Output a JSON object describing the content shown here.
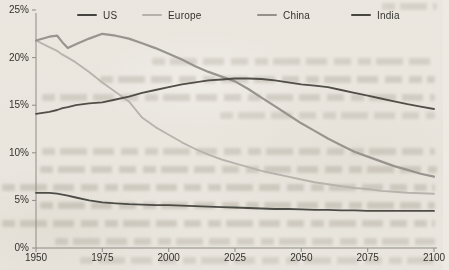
{
  "page_background": "#edeae3",
  "axis_color": "#8d8c85",
  "label_color": "#33322d",
  "chart_data": {
    "type": "line",
    "title": "",
    "xlabel": "",
    "ylabel": "",
    "grid": false,
    "legend_position": "top",
    "xlim": [
      1950,
      2100
    ],
    "ylim": [
      0,
      25
    ],
    "x_tick_values": [
      1950,
      1975,
      2000,
      2025,
      2050,
      2075,
      2100
    ],
    "x_tick_labels": [
      "1950",
      "1975",
      "2000",
      "2025",
      "2050",
      "2075",
      "2100"
    ],
    "y_tick_values": [
      25,
      20,
      15,
      10,
      5,
      0
    ],
    "y_tick_labels": [
      "25%",
      "20%",
      "15%",
      "10%",
      "5%",
      "0%"
    ],
    "x": [
      1950,
      1955,
      1958,
      1960,
      1962,
      1965,
      1970,
      1975,
      1980,
      1985,
      1990,
      1995,
      2000,
      2005,
      2010,
      2015,
      2020,
      2025,
      2030,
      2035,
      2040,
      2045,
      2050,
      2055,
      2060,
      2065,
      2070,
      2075,
      2080,
      2085,
      2090,
      2095,
      2100
    ],
    "series": [
      {
        "name": "US",
        "color": "#45443f",
        "width": 1.8,
        "values": [
          5.8,
          5.8,
          5.7,
          5.6,
          5.5,
          5.3,
          5.0,
          4.8,
          4.7,
          4.6,
          4.55,
          4.5,
          4.5,
          4.45,
          4.4,
          4.35,
          4.3,
          4.25,
          4.2,
          4.15,
          4.1,
          4.1,
          4.05,
          4.0,
          4.0,
          3.95,
          3.95,
          3.9,
          3.9,
          3.9,
          3.9,
          3.9,
          3.9
        ]
      },
      {
        "name": "Europe",
        "color": "#b5b2ab",
        "width": 1.9,
        "values": [
          21.8,
          21.1,
          20.7,
          20.3,
          20.0,
          19.5,
          18.5,
          17.4,
          16.4,
          15.4,
          13.7,
          12.7,
          11.9,
          11.1,
          10.4,
          9.8,
          9.3,
          8.9,
          8.5,
          8.1,
          7.8,
          7.5,
          7.2,
          6.9,
          6.7,
          6.5,
          6.3,
          6.2,
          6.0,
          5.9,
          5.8,
          5.75,
          5.7
        ]
      },
      {
        "name": "China",
        "color": "#93918a",
        "width": 2.2,
        "values": [
          21.8,
          22.2,
          22.3,
          21.6,
          21.0,
          21.4,
          22.0,
          22.5,
          22.3,
          22.0,
          21.5,
          21.0,
          20.4,
          19.8,
          19.1,
          18.5,
          18.0,
          17.5,
          16.7,
          15.8,
          14.9,
          14.0,
          13.1,
          12.3,
          11.5,
          10.8,
          10.1,
          9.6,
          9.1,
          8.6,
          8.2,
          7.8,
          7.5
        ]
      },
      {
        "name": "India",
        "color": "#48473f",
        "width": 1.8,
        "values": [
          14.1,
          14.3,
          14.5,
          14.7,
          14.8,
          15.0,
          15.2,
          15.3,
          15.6,
          15.9,
          16.3,
          16.6,
          16.9,
          17.2,
          17.4,
          17.6,
          17.7,
          17.8,
          17.8,
          17.75,
          17.6,
          17.4,
          17.2,
          17.05,
          16.9,
          16.6,
          16.3,
          16.0,
          15.7,
          15.4,
          15.1,
          14.85,
          14.6
        ]
      }
    ]
  },
  "legend": {
    "items": [
      "US",
      "Europe",
      "China",
      "India"
    ]
  }
}
